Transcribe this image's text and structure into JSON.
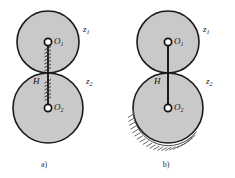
{
  "figure": {
    "colors": {
      "disk_fill": "#c9c9c9",
      "disk_stroke": "#1a1a1a",
      "shaft_stroke": "#111111",
      "hatch_stroke": "#2b2b2b",
      "ground_stroke": "#4a4a4a",
      "background": "#ffffff",
      "text": "#111111"
    },
    "panels": [
      {
        "id": "a",
        "caption": "a)",
        "supported": false,
        "shaft_style": "hatched",
        "disks": [
          {
            "id": "upper",
            "center_label": "O",
            "center_sub": "1",
            "side_label": "z",
            "side_sub": "1",
            "cx": 48,
            "cy": 42,
            "r": 31
          },
          {
            "id": "lower",
            "center_label": "O",
            "center_sub": "2",
            "side_label": "z",
            "side_sub": "2",
            "cx": 48,
            "cy": 108,
            "r": 35
          }
        ],
        "shaft_label": "H"
      },
      {
        "id": "b",
        "caption": "b)",
        "supported": true,
        "shaft_style": "solid",
        "disks": [
          {
            "id": "upper",
            "center_label": "O",
            "center_sub": "1",
            "side_label": "z",
            "side_sub": "1",
            "cx": 168,
            "cy": 42,
            "r": 31
          },
          {
            "id": "lower",
            "center_label": "O",
            "center_sub": "2",
            "side_label": "z",
            "side_sub": "2",
            "cx": 168,
            "cy": 108,
            "r": 35
          }
        ],
        "shaft_label": "H"
      }
    ]
  }
}
